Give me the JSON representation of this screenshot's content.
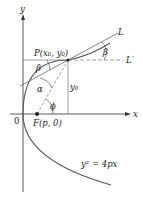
{
  "diagram": {
    "type": "parabola-reflection",
    "axes": {
      "x_label": "x",
      "y_label": "y",
      "origin_label": "0"
    },
    "point_P": "P(x₀, y₀)",
    "focus": "F(p, 0)",
    "equation": "y² = 4px",
    "lines": {
      "tangent": "L",
      "horizontal": "L′"
    },
    "angles": {
      "alpha": "α",
      "beta_left": "β",
      "beta_right": "β",
      "phi": "ϕ"
    },
    "segment_label": "y₀",
    "colors": {
      "curve": "#444444",
      "axes": "#333333",
      "lines": "#555555",
      "dashed": "#777777",
      "point": "#222222"
    }
  }
}
